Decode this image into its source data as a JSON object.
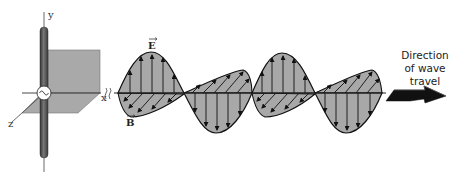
{
  "diagram": {
    "axes": {
      "x_label": "x",
      "y_label": "y",
      "z_label": "z"
    },
    "fields": {
      "electric_label": "E",
      "magnetic_label": "B"
    },
    "direction_text": {
      "line1": "Direction",
      "line2": "of wave",
      "line3": "travel"
    },
    "source_symbol": "~",
    "colors": {
      "background": "#ffffff",
      "plane_fill": "#a9a9a9",
      "wave_fill": "#a8a8a8",
      "rod": "#555555",
      "outline": "#111111",
      "arrow": "#111111"
    }
  }
}
